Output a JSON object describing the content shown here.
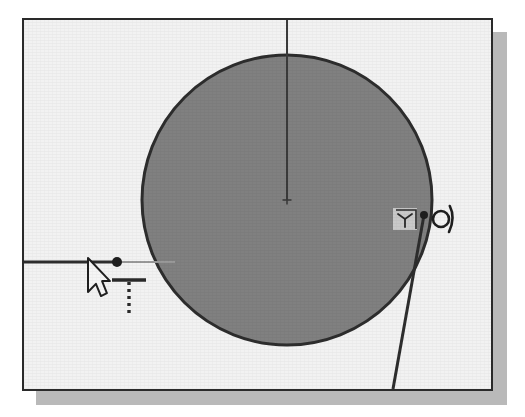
{
  "application": {
    "type": "cad-sketch-editor",
    "view": "2d-sketch-canvas",
    "window_title": "",
    "canvas_background_color": "#f2f2f2",
    "outer_background_color": "#ffffff",
    "frame_border_color": "#2a2a2a",
    "shadow_color": "#b9b9b9"
  },
  "canvas": {
    "frame": {
      "x": 22,
      "y": 18,
      "width": 471,
      "height": 373
    },
    "shadow_offset": {
      "x": 14,
      "y": 14
    }
  },
  "geometry": {
    "circle": {
      "name": "shaded-circle",
      "center_x": 287,
      "center_y": 200,
      "radius": 145,
      "fill_color": "#808080",
      "stroke_color": "#2d2d2d",
      "stroke_width": 3,
      "selected": true
    },
    "center_mark": {
      "name": "circle-center-mark",
      "x": 287,
      "y": 200,
      "size": 9,
      "color": "#3a3a3a"
    },
    "vertical_line": {
      "name": "vertical-construction-line",
      "x1": 287,
      "y1": 18,
      "x2": 287,
      "y2": 200,
      "color": "#3a3a3a",
      "width": 2
    },
    "horizontal_line": {
      "name": "horizontal-sketch-line",
      "x1": 22,
      "y1": 262,
      "x2": 117,
      "y2": 262,
      "color": "#2d2d2d",
      "width": 3
    },
    "horizontal_line_preview": {
      "name": "horizontal-line-preview-segment",
      "x1": 117,
      "y1": 262,
      "x2": 175,
      "y2": 262,
      "color": "#9a9a9a",
      "width": 2
    },
    "endpoint": {
      "name": "line-endpoint-node",
      "x": 117,
      "y": 262,
      "radius": 5,
      "color": "#1f1f1f"
    },
    "tangent_line": {
      "name": "tangent-sketch-line",
      "x1": 424,
      "y1": 215,
      "x2": 393,
      "y2": 389,
      "color": "#2d2d2d",
      "width": 3
    },
    "tangent_point": {
      "name": "tangent-point-node",
      "x": 424,
      "y": 215,
      "radius": 4,
      "color": "#1f1f1f"
    }
  },
  "cursor": {
    "name": "mouse-pointer",
    "x": 88,
    "y": 258,
    "width": 22,
    "height": 34,
    "fill_color": "#f5f5f5",
    "stroke_color": "#1f1f1f"
  },
  "constraint_indicators": [
    {
      "name": "horizontal-constraint-glyph",
      "label": "Horizontal",
      "symbol": "T-with-dashed-stem",
      "x": 112,
      "y": 280,
      "width": 34,
      "height": 36,
      "color": "#2a2a2a"
    },
    {
      "name": "tangent-constraint-cursor-badge",
      "label": "Tangent",
      "symbol": "tangent-arc-badge",
      "x": 393,
      "y": 208,
      "width": 24,
      "height": 22,
      "color": "#2a2a2a",
      "badge_background": "#c9c9c9"
    },
    {
      "name": "tangent-constraint-glyph",
      "label": "Tangent",
      "symbol": "tangent-circle-line",
      "x": 433,
      "y": 206,
      "width": 24,
      "height": 26,
      "color": "#1f1f1f"
    }
  ]
}
